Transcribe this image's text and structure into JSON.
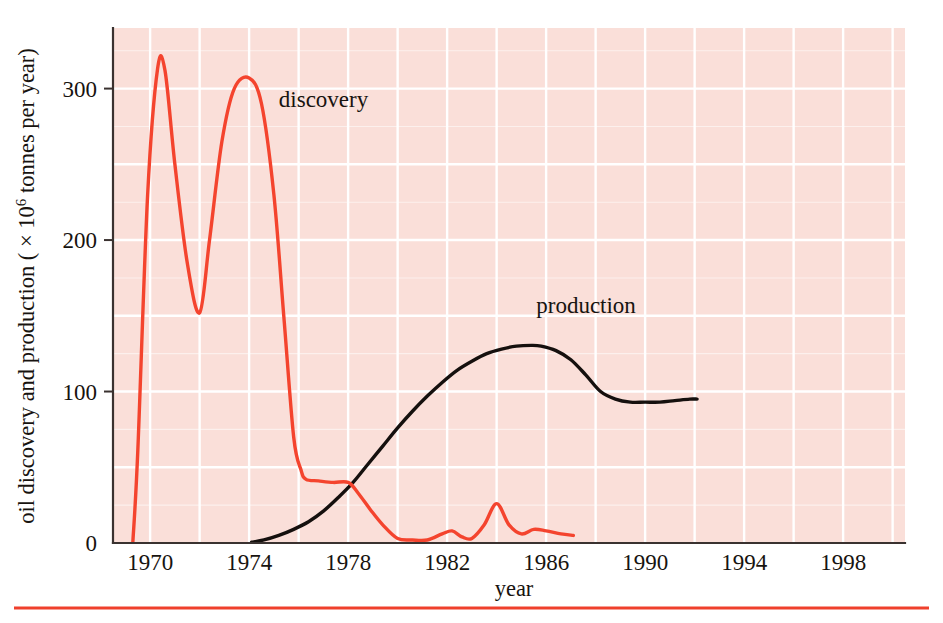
{
  "figure": {
    "background_color": "#ffffff",
    "plot_background_color": "#fadfd9",
    "grid_color": "#ffffff",
    "axis_color": "#3a3230",
    "rule_color": "#ef402c"
  },
  "axes": {
    "y_title_main": "oil discovery and production ( × 10",
    "y_title_exponent": "6",
    "y_title_tail": " tonnes per year)",
    "x_title": "year",
    "y_ticks": [
      "0",
      "100",
      "200",
      "300"
    ],
    "x_ticks": [
      "1970",
      "1974",
      "1978",
      "1982",
      "1986",
      "1990",
      "1994",
      "1998"
    ]
  },
  "labels": {
    "discovery": "discovery",
    "production": "production"
  },
  "chart_data": {
    "type": "line",
    "title": "",
    "xlabel": "year",
    "ylabel": "oil discovery and production ( × 10^6 tonnes per year)",
    "xlim": [
      1968.5,
      2000.5
    ],
    "ylim": [
      0,
      340
    ],
    "grid": true,
    "legend": "inline-annotations",
    "y_tick_values": [
      0,
      100,
      200,
      300
    ],
    "x_tick_values": [
      1970,
      1974,
      1978,
      1982,
      1986,
      1990,
      1994,
      1998
    ],
    "series": [
      {
        "name": "discovery",
        "color": "#f4442e",
        "x": [
          1969.3,
          1969.5,
          1969.9,
          1970.3,
          1970.6,
          1971.0,
          1971.5,
          1972.0,
          1972.4,
          1972.9,
          1973.4,
          1974.0,
          1974.5,
          1975.0,
          1975.4,
          1975.8,
          1976.1,
          1976.3,
          1976.8,
          1977.4,
          1978.0,
          1978.4,
          1978.9,
          1979.4,
          1980.0,
          1980.6,
          1981.2,
          1981.8,
          1982.2,
          1982.6,
          1983.0,
          1983.5,
          1984.0,
          1984.5,
          1985.0,
          1985.5,
          1986.0,
          1986.6,
          1987.1
        ],
        "y": [
          0,
          60,
          230,
          313,
          312,
          250,
          185,
          152,
          200,
          265,
          300,
          307,
          290,
          230,
          150,
          70,
          48,
          42,
          41,
          40,
          40,
          33,
          22,
          12,
          3,
          2,
          2,
          6,
          8,
          4,
          3,
          12,
          26,
          12,
          6,
          9,
          8,
          6,
          5
        ]
      },
      {
        "name": "production",
        "color": "#15100e",
        "x": [
          1974.1,
          1974.6,
          1975.2,
          1975.8,
          1976.4,
          1977.0,
          1977.6,
          1978.2,
          1978.8,
          1979.4,
          1980.0,
          1980.6,
          1981.2,
          1981.8,
          1982.4,
          1983.0,
          1983.6,
          1984.2,
          1984.8,
          1985.4,
          1985.8,
          1986.4,
          1987.0,
          1987.6,
          1988.2,
          1988.8,
          1989.4,
          1990.0,
          1990.6,
          1991.2,
          1991.8,
          1992.1
        ],
        "y": [
          0.5,
          2,
          5,
          9,
          14,
          21,
          30,
          40,
          52,
          64,
          76,
          87,
          97,
          106,
          114,
          120,
          125,
          128,
          130,
          130.5,
          130,
          127,
          121,
          111,
          100,
          95,
          93,
          93,
          93,
          94,
          95,
          95
        ]
      }
    ],
    "annotations": [
      {
        "text": "discovery",
        "x": 1975.2,
        "y": 288
      },
      {
        "text": "production",
        "x": 1985.6,
        "y": 152
      }
    ]
  }
}
